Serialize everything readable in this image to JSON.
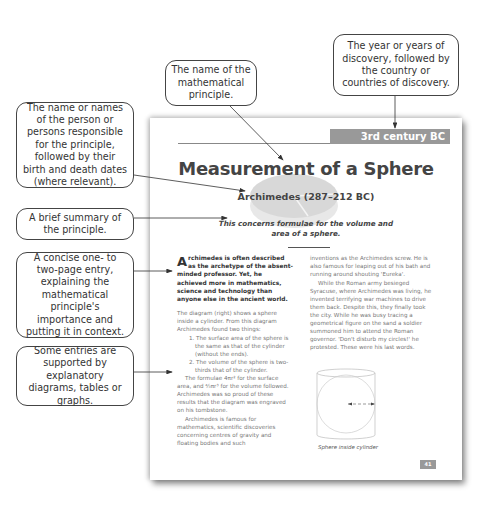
{
  "callouts": {
    "name": "The name or names of the person or persons responsible for the principle, followed by their birth and death dates (where relevant).",
    "summary": "A brief summary of the principle.",
    "entry": "A concise one- to two-page entry, explaining the mathematical principle's importance and putting it in context.",
    "diagrams": "Some entries are supported by explanatory diagrams, tables or graphs.",
    "principle": "The name of the mathematical principle.",
    "year": "The year or years of discovery, followed by the country or countries of discovery."
  },
  "page": {
    "band": "3rd century BC Greece",
    "title": "Measurement of a Sphere",
    "person": "Archimedes (287–212 BC)",
    "summary": "This concerns formulae for the volume and area of a sphere.",
    "lead_dropcap": "A",
    "lead_text": "rchimedes is often described as the archetype of the absent-minded professor. Yet, he achieved more in mathematics, science and technology than anyone else in the ancient world.",
    "left_paragraphs": {
      "p1": "The diagram (right) shows a sphere inside a cylinder. From this diagram Archimedes found two things:",
      "item1": "1. The surface area of the sphere is the same as that of the cylinder (without the ends).",
      "item2": "2. The volume of the sphere is two-thirds that of the cylinder.",
      "p2": "The formulae 4πr² for the surface area, and ⁴⁄₃πr³ for the volume followed. Archimedes was so proud of these results that the diagram was engraved on his tombstone.",
      "p3": "Archimedes is famous for mathematics, scientific discoveries concerning centres of gravity and floating bodies and such"
    },
    "right_paragraphs": {
      "p1": "inventions as the Archimedes screw. He is also famous for leaping out of his bath and running around shouting 'Eureka'.",
      "p2": "While the Roman army besieged Syracuse, where Archimedes was living, he invented terrifying war machines to drive them back. Despite this, they finally took the city. While he was busy tracing a geometrical figure on the sand a soldier summoned him to attend the Roman governor. 'Don't disturb my circles!' he protested. These were his last words."
    },
    "caption": "Sphere inside cylinder",
    "page_number": "41"
  }
}
